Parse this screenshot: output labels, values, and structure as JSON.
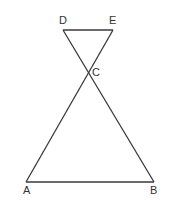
{
  "diagram": {
    "points": {
      "A": {
        "label": "A",
        "x": 26,
        "y": 182
      },
      "B": {
        "label": "B",
        "x": 154,
        "y": 182
      },
      "C": {
        "label": "C",
        "x": 88,
        "y": 72
      },
      "D": {
        "label": "D",
        "x": 63,
        "y": 30
      },
      "E": {
        "label": "E",
        "x": 113,
        "y": 30
      }
    },
    "segments": [
      [
        "D",
        "E"
      ],
      [
        "D",
        "B"
      ],
      [
        "E",
        "A"
      ],
      [
        "A",
        "B"
      ]
    ],
    "line_color": "#3a3a3a"
  }
}
